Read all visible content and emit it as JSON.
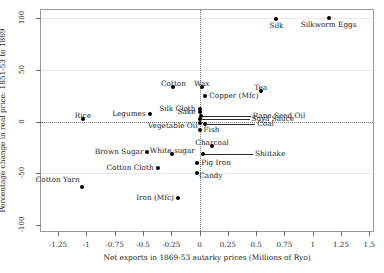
{
  "chart_data": {
    "type": "scatter",
    "title": "",
    "xlabel": "Net exports in 1869-53 autarky prices  (Millions of Ryo)",
    "ylabel": "Percentage change in real price: 1851-53 to 1869",
    "xlim": [
      -1.4,
      1.55
    ],
    "ylim": [
      -108,
      108
    ],
    "xticks": [
      -1.25,
      -1,
      -0.75,
      -0.5,
      -0.25,
      0,
      0.25,
      0.5,
      0.75,
      1,
      1.25,
      1.5
    ],
    "xticklabels": [
      "-1.25",
      "-1",
      "-0.75",
      "-0.5",
      "-0.25",
      "0",
      "0.25",
      "0.5",
      "0.75",
      "1",
      "1.25",
      "1.5"
    ],
    "yticks": [
      100,
      50,
      0,
      -50,
      -100
    ],
    "yticklabels": [
      "100",
      "50",
      "0",
      "-50",
      "-100"
    ],
    "grid": true,
    "gridlines_y": [
      100,
      50,
      -50
    ],
    "zero_line_x": 0,
    "zero_line_y": 0,
    "legend": null,
    "points": [
      {
        "label": "Silk",
        "x": 0.68,
        "y": 99,
        "lpos": "below"
      },
      {
        "label": "Silkworm Eggs",
        "x": 1.14,
        "y": 100,
        "lpos": "below"
      },
      {
        "label": "Cotton",
        "x": -0.23,
        "y": 33,
        "lpos": "above"
      },
      {
        "label": "Wax",
        "x": 0.02,
        "y": 33,
        "lpos": "above"
      },
      {
        "label": "Tea",
        "x": 0.54,
        "y": 30,
        "lpos": "above"
      },
      {
        "label": "Copper (Mfc)",
        "x": 0.05,
        "y": 25,
        "lpos": "right"
      },
      {
        "label": "Silk Cloth",
        "x": 0.0,
        "y": 12,
        "lpos": "left"
      },
      {
        "label": "Sake",
        "x": 0.0,
        "y": 9,
        "lpos": "left"
      },
      {
        "label": "Rape Seed Oil",
        "x": 0.01,
        "y": 5,
        "lpos": "leader-right"
      },
      {
        "label": "Legumes",
        "x": -0.44,
        "y": 7,
        "lpos": "left"
      },
      {
        "label": "Soya Sauce",
        "x": 0.0,
        "y": 2,
        "lpos": "leader-right"
      },
      {
        "label": "Rice",
        "x": -1.03,
        "y": 2,
        "lpos": "above"
      },
      {
        "label": "Vegetable Oil",
        "x": 0.0,
        "y": -1,
        "lpos": "below-left"
      },
      {
        "label": "Coal",
        "x": 0.05,
        "y": -2,
        "lpos": "leader-right"
      },
      {
        "label": "Fish",
        "x": 0.0,
        "y": -8,
        "lpos": "right"
      },
      {
        "label": "Charcoal",
        "x": 0.11,
        "y": -24,
        "lpos": "above"
      },
      {
        "label": "White sugar",
        "x": -0.24,
        "y": -31,
        "lpos": "above"
      },
      {
        "label": "Shiitake",
        "x": 0.03,
        "y": -31,
        "lpos": "leader-right"
      },
      {
        "label": "Brown Sugar",
        "x": -0.46,
        "y": -30,
        "lpos": "left"
      },
      {
        "label": "Pig Iron",
        "x": -0.02,
        "y": -40,
        "lpos": "right"
      },
      {
        "label": "Cotton Cloth",
        "x": -0.37,
        "y": -45,
        "lpos": "left"
      },
      {
        "label": "Candy",
        "x": -0.02,
        "y": -50,
        "lpos": "below-right"
      },
      {
        "label": "Cotton Yarn",
        "x": -1.04,
        "y": -63,
        "lpos": "above-left"
      },
      {
        "label": "Iron (Mfc)",
        "x": -0.19,
        "y": -74,
        "lpos": "left"
      }
    ]
  }
}
